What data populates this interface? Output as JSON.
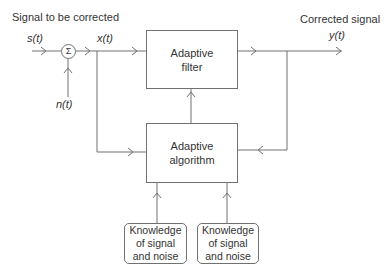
{
  "labels": {
    "input_title": "Signal to be corrected",
    "output_title": "Corrected signal",
    "input_var": "s(t)",
    "noise_var": "n(t)",
    "mixed_var": "x(t)",
    "output_var": "y(t)"
  },
  "nodes": {
    "summing_junction": "Σ",
    "adaptive_filter": [
      "Adaptive",
      "filter"
    ],
    "adaptive_algorithm": [
      "Adaptive",
      "algorithm"
    ],
    "knowledge_left": [
      "Knowledge",
      "of signal",
      "and noise"
    ],
    "knowledge_right": [
      "Knowledge",
      "of signal",
      "and noise"
    ]
  },
  "colors": {
    "line": "#707070",
    "text": "#333333"
  }
}
